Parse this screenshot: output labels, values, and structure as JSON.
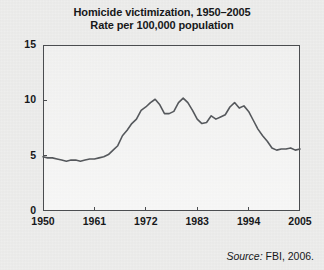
{
  "title": {
    "line1": "Homicide victimization, 1950–2005",
    "line2": "Rate per 100,000 population"
  },
  "source": {
    "keyword": "Source:",
    "text": " FBI, 2006."
  },
  "colors": {
    "line": "#55585c",
    "frame": "#4b4d50",
    "text": "#17181a",
    "background": "#e5e5e3"
  },
  "chart_data": {
    "type": "line",
    "xlabel": "",
    "ylabel": "Rate per 100,000 population",
    "xlim": [
      1950,
      2005
    ],
    "ylim": [
      0,
      15
    ],
    "yticks": [
      0,
      5,
      10,
      15
    ],
    "ytick_labels": [
      "0",
      "5",
      "10",
      "15"
    ],
    "xticks": [
      1950,
      1961,
      1972,
      1983,
      1994,
      2005
    ],
    "xtick_labels": [
      "1950",
      "1961",
      "1972",
      "1983",
      "1994",
      "2005"
    ],
    "grid": false,
    "legend": null,
    "series": [
      {
        "name": "Homicide victimization rate",
        "x": [
          1950,
          1951,
          1952,
          1953,
          1954,
          1955,
          1956,
          1957,
          1958,
          1959,
          1960,
          1961,
          1962,
          1963,
          1964,
          1965,
          1966,
          1967,
          1968,
          1969,
          1970,
          1971,
          1972,
          1973,
          1974,
          1975,
          1976,
          1977,
          1978,
          1979,
          1980,
          1981,
          1982,
          1983,
          1984,
          1985,
          1986,
          1987,
          1988,
          1989,
          1990,
          1991,
          1992,
          1993,
          1994,
          1995,
          1996,
          1997,
          1998,
          1999,
          2000,
          2001,
          2002,
          2003,
          2004,
          2005
        ],
        "values": [
          4.9,
          4.8,
          4.8,
          4.7,
          4.6,
          4.5,
          4.6,
          4.6,
          4.5,
          4.6,
          4.7,
          4.7,
          4.8,
          4.9,
          5.1,
          5.5,
          5.9,
          6.8,
          7.3,
          7.9,
          8.3,
          9.1,
          9.4,
          9.8,
          10.1,
          9.6,
          8.8,
          8.8,
          9.0,
          9.8,
          10.2,
          9.8,
          9.1,
          8.3,
          7.9,
          8.0,
          8.6,
          8.3,
          8.5,
          8.7,
          9.4,
          9.8,
          9.3,
          9.5,
          9.0,
          8.2,
          7.4,
          6.8,
          6.3,
          5.7,
          5.5,
          5.6,
          5.6,
          5.7,
          5.5,
          5.6
        ]
      }
    ]
  }
}
